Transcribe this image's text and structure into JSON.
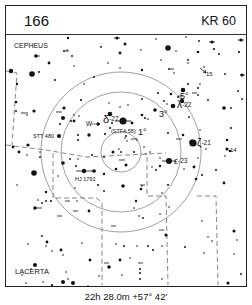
{
  "header": {
    "chart_number": "166",
    "object_name": "KR 60"
  },
  "labels": {
    "constellation_top": "CEPHEUS",
    "constellation_bottom": "LACERTA",
    "ring_1": "1°",
    "ring_3": "3°",
    "ring_5": "5°",
    "delta": "δ",
    "delta_mag": "-27",
    "stfa": "(STFA 58)",
    "w_arrow": "W",
    "lambda": "λ",
    "lambda_mag": "-22",
    "zeta": "ζ",
    "zeta_mag": "-21",
    "epsilon": "ε",
    "epsilon_mag": "-23",
    "stt480": "STT 480",
    "hj1791": "HJ 1791",
    "star_15": "15",
    "star_14": "14"
  },
  "caption": "22h 28.0m  +57° 42'",
  "colors": {
    "ink": "#111111",
    "ring": "#888888",
    "boundary": "#555555",
    "background": "#ffffff"
  }
}
